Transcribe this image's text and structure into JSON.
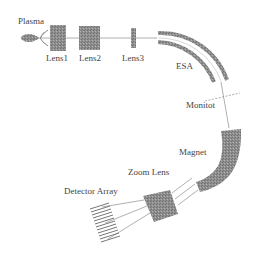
{
  "diagram": {
    "type": "mass-spectrometer-schematic",
    "labels": {
      "plasma": "Plasma",
      "lens1": "Lens1",
      "lens2": "Lens2",
      "lens3": "Lens3",
      "esa": "ESA",
      "monitor": "Monitot",
      "magnet": "Magnet",
      "zoom_lens": "Zoom Lens",
      "detector_array": "Detector Array"
    },
    "colors": {
      "component_fill": "#8a8a8a",
      "line": "#7a7a7a",
      "text": "#444444",
      "background": "#ffffff"
    },
    "detector_channels": 12
  }
}
